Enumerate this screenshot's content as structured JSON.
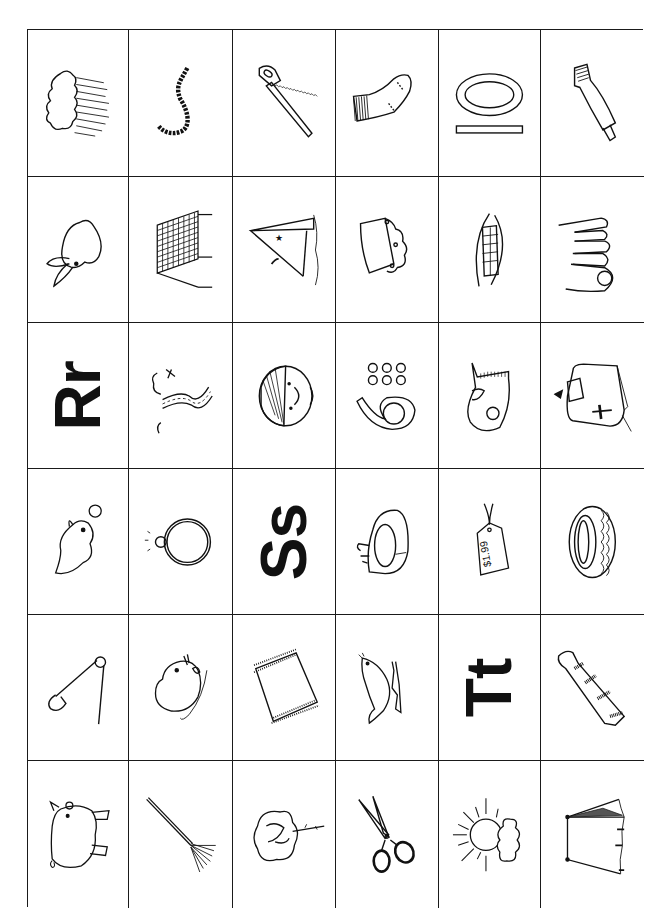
{
  "worksheet": {
    "type": "picture-letter matching grid",
    "orientation": "rotated 90 degrees",
    "rows": 6,
    "columns": 6,
    "line_color": "#1a1a1a",
    "cells": [
      [
        {
          "kind": "picture",
          "label": "rain cloud"
        },
        {
          "kind": "picture",
          "label": "rope"
        },
        {
          "kind": "picture",
          "label": "saw"
        },
        {
          "kind": "picture",
          "label": "sock"
        },
        {
          "kind": "picture",
          "label": "soap"
        },
        {
          "kind": "picture",
          "label": "toothpaste"
        }
      ],
      [
        {
          "kind": "picture",
          "label": "rabbit"
        },
        {
          "kind": "picture",
          "label": "rack"
        },
        {
          "kind": "picture",
          "label": "sail"
        },
        {
          "kind": "picture",
          "label": "sandwich"
        },
        {
          "kind": "picture",
          "label": "teeth"
        },
        {
          "kind": "picture",
          "label": "toes"
        }
      ],
      [
        {
          "kind": "letter",
          "text": "Rr"
        },
        {
          "kind": "picture",
          "label": "river"
        },
        {
          "kind": "picture",
          "label": "sad face"
        },
        {
          "kind": "picture",
          "label": "six"
        },
        {
          "kind": "picture",
          "label": "tape"
        },
        {
          "kind": "picture",
          "label": "toaster"
        }
      ],
      [
        {
          "kind": "picture",
          "label": "seal pup"
        },
        {
          "kind": "picture",
          "label": "ring"
        },
        {
          "kind": "letter",
          "text": "Ss"
        },
        {
          "kind": "picture",
          "label": "sink"
        },
        {
          "kind": "picture",
          "label": "tag",
          "text": "$1.99"
        },
        {
          "kind": "picture",
          "label": "tire"
        }
      ],
      [
        {
          "kind": "picture",
          "label": "safety pin"
        },
        {
          "kind": "picture",
          "label": "rat"
        },
        {
          "kind": "picture",
          "label": "rug"
        },
        {
          "kind": "picture",
          "label": "seal"
        },
        {
          "kind": "letter",
          "text": "Tt"
        },
        {
          "kind": "picture",
          "label": "tie"
        }
      ],
      [
        {
          "kind": "picture",
          "label": "pig"
        },
        {
          "kind": "picture",
          "label": "rake"
        },
        {
          "kind": "picture",
          "label": "rose"
        },
        {
          "kind": "picture",
          "label": "scissors"
        },
        {
          "kind": "picture",
          "label": "sun"
        },
        {
          "kind": "picture",
          "label": "tent"
        }
      ]
    ]
  }
}
